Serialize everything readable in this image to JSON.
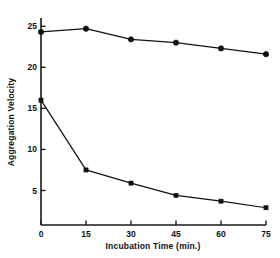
{
  "chart_data": {
    "type": "line",
    "title": "",
    "subtitle": "",
    "xlabel": "Incubation Time (min.)",
    "ylabel": "Aggregation Velocity",
    "x": [
      0,
      15,
      30,
      45,
      60,
      75
    ],
    "xticks": [
      "0",
      "15",
      "30",
      "45",
      "60",
      "75"
    ],
    "yticks": [
      "5",
      "10",
      "15",
      "20",
      "25"
    ],
    "ytickvalues": [
      5,
      10,
      15,
      20,
      25
    ],
    "xlim": [
      0,
      75
    ],
    "ylim": [
      0.8,
      26
    ],
    "grid": false,
    "legend": "none",
    "series": [
      {
        "name": "upper-series",
        "marker": "filled-circle",
        "values": [
          24.3,
          24.7,
          23.4,
          23.0,
          22.3,
          21.6
        ]
      },
      {
        "name": "lower-series",
        "marker": "filled-square",
        "values": [
          16.0,
          7.5,
          5.9,
          4.4,
          3.7,
          2.9
        ]
      }
    ]
  },
  "axis_titles": {
    "x": "Incubation Time (min.)",
    "y": "Aggregation Velocity"
  }
}
